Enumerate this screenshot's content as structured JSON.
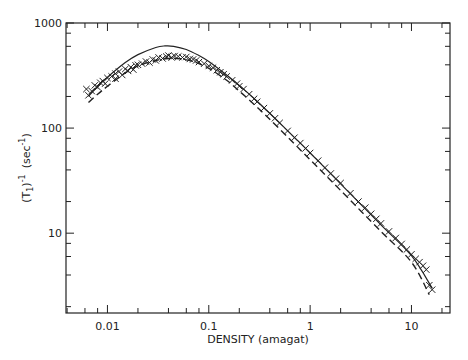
{
  "chart_data": {
    "type": "scatter",
    "title": "",
    "xlabel": "DENSITY  (amagat)",
    "ylabel": "(T1)^-1  (sec^-1)",
    "ylabel_parts": {
      "main": "(T",
      "sub": "1",
      "close": ")",
      "sup": "-1",
      "unit": "(sec",
      "unit_sup": "-1",
      "unit_close": ")"
    },
    "xscale": "log",
    "yscale": "log",
    "xlim": [
      0.0039,
      24
    ],
    "ylim": [
      1.74,
      1000
    ],
    "x_ticks": [
      {
        "value": 0.01,
        "label": "0.01"
      },
      {
        "value": 0.1,
        "label": "0.1"
      },
      {
        "value": 1,
        "label": "1"
      },
      {
        "value": 10,
        "label": "10"
      }
    ],
    "y_ticks": [
      {
        "value": 10,
        "label": "10"
      },
      {
        "value": 100,
        "label": "100"
      },
      {
        "value": 1000,
        "label": "1000"
      }
    ],
    "grid": false,
    "legend": null,
    "series": [
      {
        "name": "measured data",
        "style": "x-markers",
        "points": [
          [
            0.0062,
            235
          ],
          [
            0.0065,
            205
          ],
          [
            0.007,
            225
          ],
          [
            0.0075,
            255
          ],
          [
            0.008,
            245
          ],
          [
            0.0085,
            270
          ],
          [
            0.009,
            280
          ],
          [
            0.0095,
            265
          ],
          [
            0.01,
            300
          ],
          [
            0.011,
            310
          ],
          [
            0.012,
            330
          ],
          [
            0.012,
            295
          ],
          [
            0.013,
            345
          ],
          [
            0.014,
            320
          ],
          [
            0.015,
            365
          ],
          [
            0.016,
            350
          ],
          [
            0.017,
            380
          ],
          [
            0.018,
            360
          ],
          [
            0.019,
            395
          ],
          [
            0.02,
            400
          ],
          [
            0.022,
            410
          ],
          [
            0.024,
            430
          ],
          [
            0.026,
            420
          ],
          [
            0.028,
            450
          ],
          [
            0.03,
            440
          ],
          [
            0.032,
            470
          ],
          [
            0.035,
            460
          ],
          [
            0.038,
            480
          ],
          [
            0.04,
            490
          ],
          [
            0.043,
            470
          ],
          [
            0.046,
            485
          ],
          [
            0.05,
            480
          ],
          [
            0.055,
            470
          ],
          [
            0.06,
            475
          ],
          [
            0.065,
            455
          ],
          [
            0.07,
            450
          ],
          [
            0.075,
            440
          ],
          [
            0.08,
            425
          ],
          [
            0.09,
            410
          ],
          [
            0.1,
            390
          ],
          [
            0.11,
            375
          ],
          [
            0.12,
            355
          ],
          [
            0.13,
            340
          ],
          [
            0.14,
            325
          ],
          [
            0.15,
            310
          ],
          [
            0.17,
            285
          ],
          [
            0.19,
            265
          ],
          [
            0.2,
            250
          ],
          [
            0.22,
            235
          ],
          [
            0.25,
            210
          ],
          [
            0.28,
            190
          ],
          [
            0.3,
            178
          ],
          [
            0.35,
            155
          ],
          [
            0.4,
            138
          ],
          [
            0.45,
            124
          ],
          [
            0.5,
            112
          ],
          [
            0.6,
            94
          ],
          [
            0.7,
            81
          ],
          [
            0.8,
            72
          ],
          [
            0.9,
            64
          ],
          [
            1.0,
            58
          ],
          [
            1.2,
            49
          ],
          [
            1.4,
            42
          ],
          [
            1.6,
            37
          ],
          [
            1.8,
            33
          ],
          [
            2.0,
            30
          ],
          [
            2.5,
            24
          ],
          [
            3.0,
            20
          ],
          [
            3.5,
            17.5
          ],
          [
            4.0,
            15.3
          ],
          [
            4.5,
            13.7
          ],
          [
            5.0,
            12.4
          ],
          [
            6.0,
            10.4
          ],
          [
            7.0,
            9.0
          ],
          [
            8.0,
            7.9
          ],
          [
            9.0,
            7.0
          ],
          [
            10.0,
            6.3
          ],
          [
            11.0,
            5.7
          ],
          [
            12.0,
            5.3
          ],
          [
            13.0,
            4.9
          ],
          [
            14.0,
            4.5
          ],
          [
            15.0,
            3.2
          ],
          [
            16.0,
            2.9
          ]
        ]
      },
      {
        "name": "theory (solid)",
        "style": "solid-line",
        "points": [
          [
            0.0065,
            200
          ],
          [
            0.008,
            250
          ],
          [
            0.01,
            305
          ],
          [
            0.015,
            420
          ],
          [
            0.02,
            500
          ],
          [
            0.03,
            585
          ],
          [
            0.037,
            605
          ],
          [
            0.045,
            600
          ],
          [
            0.06,
            560
          ],
          [
            0.08,
            490
          ],
          [
            0.1,
            430
          ],
          [
            0.15,
            320
          ],
          [
            0.2,
            255
          ],
          [
            0.3,
            180
          ],
          [
            0.5,
            112
          ],
          [
            1.0,
            58
          ],
          [
            2.0,
            29.5
          ],
          [
            5.0,
            12
          ],
          [
            10.0,
            6.1
          ],
          [
            16.0,
            3.0
          ]
        ]
      },
      {
        "name": "theory (dashed)",
        "style": "dashed-line",
        "points": [
          [
            0.0065,
            175
          ],
          [
            0.008,
            210
          ],
          [
            0.01,
            250
          ],
          [
            0.015,
            335
          ],
          [
            0.02,
            390
          ],
          [
            0.03,
            440
          ],
          [
            0.04,
            460
          ],
          [
            0.05,
            458
          ],
          [
            0.07,
            430
          ],
          [
            0.1,
            370
          ],
          [
            0.15,
            285
          ],
          [
            0.2,
            225
          ],
          [
            0.3,
            158
          ],
          [
            0.5,
            98
          ],
          [
            1.0,
            50
          ],
          [
            2.0,
            25.5
          ],
          [
            5.0,
            10.4
          ],
          [
            10.0,
            5.3
          ],
          [
            15.0,
            2.6
          ]
        ]
      }
    ]
  },
  "plot_box": {
    "left": 66,
    "right": 450,
    "top": 23,
    "bottom": 313
  }
}
